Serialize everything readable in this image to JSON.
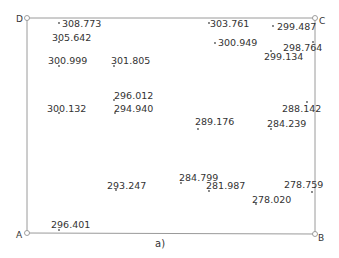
{
  "figure": {
    "caption": "a)",
    "corners": {
      "A": "A",
      "B": "B",
      "C": "C",
      "D": "D"
    },
    "points": [
      {
        "label": "308.773"
      },
      {
        "label": "305.642"
      },
      {
        "label": "300.999"
      },
      {
        "label": "301.805"
      },
      {
        "label": "303.761"
      },
      {
        "label": "300.949"
      },
      {
        "label": "299.487"
      },
      {
        "label": "298.764"
      },
      {
        "label": "299.134"
      },
      {
        "label": "296.012"
      },
      {
        "label": "294.940"
      },
      {
        "label": "300.132"
      },
      {
        "label": "289.176"
      },
      {
        "label": "288.142"
      },
      {
        "label": "284.239"
      },
      {
        "label": "293.247"
      },
      {
        "label": "284.799"
      },
      {
        "label": "281.987"
      },
      {
        "label": "278.020"
      },
      {
        "label": "278.759"
      },
      {
        "label": "296.401"
      }
    ],
    "colors": {
      "line": "#9a9a9a",
      "text": "#333333",
      "point": "#555555"
    }
  }
}
